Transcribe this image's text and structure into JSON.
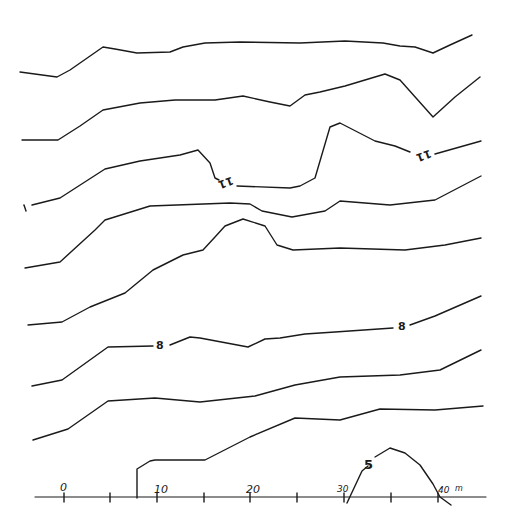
{
  "diagram": {
    "type": "contour-map",
    "contour_labels": [
      "11",
      "11",
      "8",
      "8",
      "5",
      "1"
    ],
    "scale_axis": {
      "ticks": [
        "0",
        "10",
        "20",
        "30",
        "40"
      ],
      "unit": "m"
    }
  }
}
